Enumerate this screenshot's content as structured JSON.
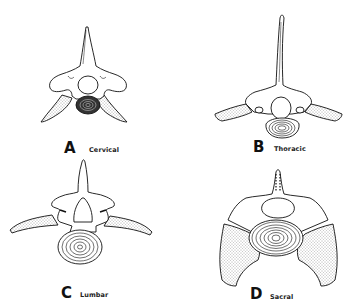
{
  "figure": {
    "panels": [
      {
        "letter": "A",
        "name": "Cervical"
      },
      {
        "letter": "B",
        "name": "Thoracic"
      },
      {
        "letter": "C",
        "name": "Lumbar"
      },
      {
        "letter": "D",
        "name": "Sacral"
      }
    ],
    "colors": {
      "ink": "#111111",
      "background": "#ffffff",
      "stipple": "#555555"
    }
  }
}
